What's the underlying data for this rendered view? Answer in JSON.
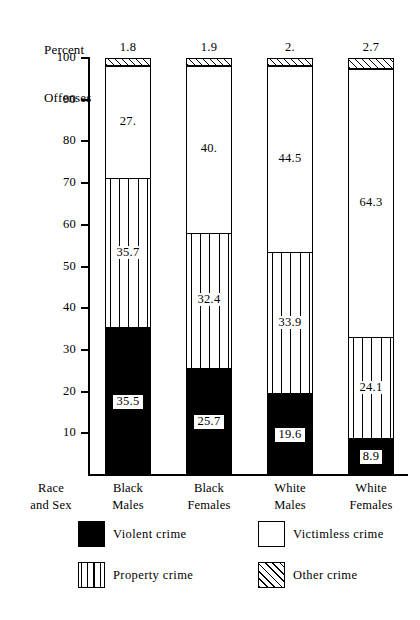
{
  "chart_data": {
    "type": "bar",
    "subtype": "stacked-bar-100",
    "title": "Percent Offenses",
    "title_lines": [
      "Percent",
      "Offenses"
    ],
    "xlabel_lines": [
      "Race",
      "and Sex"
    ],
    "ylabel": "Percent Offenses",
    "ylim": [
      0,
      100
    ],
    "yticks": [
      10,
      20,
      30,
      40,
      50,
      60,
      70,
      80,
      90,
      100
    ],
    "ytick_labels": [
      "10",
      "20",
      "30",
      "40",
      "50",
      "60",
      "70",
      "80",
      "90",
      "100"
    ],
    "grid": false,
    "legend_position": "bottom",
    "categories": [
      "Black Males",
      "Black Females",
      "White Males",
      "White Females"
    ],
    "category_label_lines": [
      [
        "Black",
        "Males"
      ],
      [
        "Black",
        "Females"
      ],
      [
        "White",
        "Males"
      ],
      [
        "White",
        "Females"
      ]
    ],
    "series": [
      {
        "name": "Violent crime",
        "fill": "solid-black",
        "color": "#000000",
        "values": [
          35.5,
          25.7,
          19.6,
          8.9
        ],
        "labels": [
          "35.5",
          "25.7",
          "19.6",
          "8.9"
        ]
      },
      {
        "name": "Property crime",
        "fill": "vertical-stripes",
        "color": "#ffffff",
        "values": [
          35.7,
          32.4,
          33.9,
          24.1
        ],
        "labels": [
          "35.7",
          "32.4",
          "33.9",
          "24.1"
        ]
      },
      {
        "name": "Victimless crime",
        "fill": "white",
        "color": "#ffffff",
        "values": [
          27.0,
          40.0,
          44.5,
          64.3
        ],
        "labels": [
          "27.",
          "40.",
          "44.5",
          "64.3"
        ]
      },
      {
        "name": "Other crime",
        "fill": "diagonal-hatch",
        "color": "#ffffff",
        "values": [
          1.8,
          1.9,
          2.0,
          2.7
        ],
        "labels": [
          "1.8",
          "1.9",
          "2.",
          "2.7"
        ]
      }
    ]
  },
  "legend": {
    "items": [
      {
        "label": "Violent crime",
        "swatch": "violent"
      },
      {
        "label": "Victimless crime",
        "swatch": "victimless"
      },
      {
        "label": "Property crime",
        "swatch": "property"
      },
      {
        "label": "Other crime",
        "swatch": "other"
      }
    ]
  }
}
